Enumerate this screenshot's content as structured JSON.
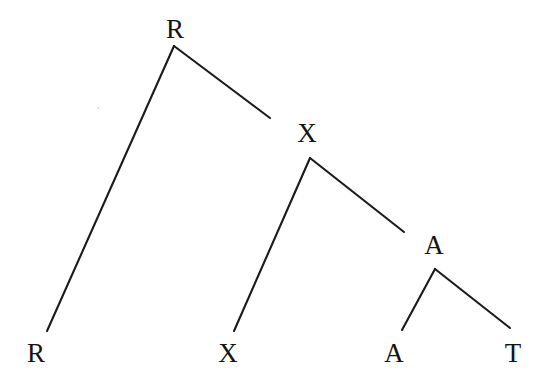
{
  "diagram": {
    "type": "tree",
    "background_color": "#ffffff",
    "line_color": "#1a1a1a",
    "text_color": "#141414",
    "width": 546,
    "height": 390,
    "nodes": [
      {
        "id": "root-r",
        "label": "R",
        "x": 175,
        "y": 29,
        "level": 0,
        "role": "root"
      },
      {
        "id": "leaf-r",
        "label": "R",
        "x": 36,
        "y": 353,
        "level": 3,
        "role": "leaf"
      },
      {
        "id": "branch-x",
        "label": "X",
        "x": 307,
        "y": 133,
        "level": 1,
        "role": "internal"
      },
      {
        "id": "leaf-x",
        "label": "X",
        "x": 228,
        "y": 353,
        "level": 3,
        "role": "leaf"
      },
      {
        "id": "branch-a",
        "label": "A",
        "x": 434,
        "y": 245,
        "level": 2,
        "role": "internal"
      },
      {
        "id": "leaf-a",
        "label": "A",
        "x": 394,
        "y": 353,
        "level": 3,
        "role": "leaf"
      },
      {
        "id": "leaf-t",
        "label": "T",
        "x": 513,
        "y": 353,
        "level": 3,
        "role": "leaf"
      }
    ],
    "edges": [
      {
        "id": "edge-r-to-r",
        "from": "root-r",
        "to": "leaf-r",
        "x1": 174,
        "y1": 46,
        "x2": 47,
        "y2": 331
      },
      {
        "id": "edge-r-to-x",
        "from": "root-r",
        "to": "branch-x",
        "x1": 174,
        "y1": 46,
        "x2": 270,
        "y2": 118
      },
      {
        "id": "edge-x-to-x",
        "from": "branch-x",
        "to": "leaf-x",
        "x1": 310,
        "y1": 158,
        "x2": 234,
        "y2": 331
      },
      {
        "id": "edge-x-to-a",
        "from": "branch-x",
        "to": "branch-a",
        "x1": 310,
        "y1": 158,
        "x2": 404,
        "y2": 232
      },
      {
        "id": "edge-a-to-a",
        "from": "branch-a",
        "to": "leaf-a",
        "x1": 435,
        "y1": 269,
        "x2": 402,
        "y2": 330
      },
      {
        "id": "edge-a-to-t",
        "from": "branch-a",
        "to": "leaf-t",
        "x1": 435,
        "y1": 269,
        "x2": 510,
        "y2": 328
      }
    ],
    "speck": {
      "x": 97,
      "y": 107
    }
  }
}
